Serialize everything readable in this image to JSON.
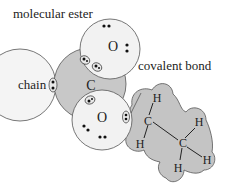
{
  "title": "molecular ester",
  "labels": {
    "chain": "chain",
    "covalent_bond": "covalent bond"
  },
  "atoms": {
    "carbon_center": "C",
    "oxygen_top": "O",
    "oxygen_bottom": "O",
    "ethyl_c1": "C",
    "ethyl_c2": "C",
    "h1": "H",
    "h2": "H",
    "h3": "H",
    "h4": "H",
    "h5": "H"
  },
  "colors": {
    "carbon_fill": "#c8c8c8",
    "oxygen_fill": "#f2f2f2",
    "chain_fill": "#f4f4f4",
    "ethyl_fill": "#c4c4c4",
    "outline": "#555555"
  }
}
